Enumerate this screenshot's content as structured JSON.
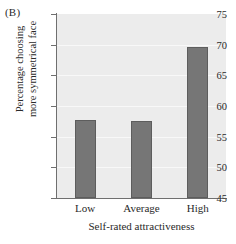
{
  "panel": {
    "label": "(B)"
  },
  "chart_data": {
    "type": "bar",
    "title": "",
    "categories": [
      "Low",
      "Average",
      "High"
    ],
    "values": [
      57.7,
      57.5,
      69.6
    ],
    "xlabel": "Self-rated attractiveness",
    "ylabel_line1": "Percentage choosing",
    "ylabel_line2": "more symmetrical face",
    "ylim": [
      45,
      75
    ],
    "yticks": [
      45,
      50,
      55,
      60,
      65,
      70,
      75
    ],
    "ytick_labels": [
      "45",
      "50",
      "55",
      "60",
      "65",
      "70",
      "75"
    ],
    "grid": true,
    "legend": "none",
    "colors": {
      "bar_fill": "#767676",
      "bar_edge": "#5d5d5d",
      "plot_background": "#ececec",
      "gridline": "#f8f8f8",
      "axis": "#6f6f6f",
      "text": "#2a2a2a"
    }
  }
}
